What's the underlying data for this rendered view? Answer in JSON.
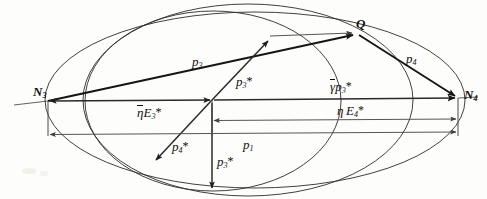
{
  "figure": {
    "type": "vector-geometry-diagram",
    "background_color": "#fdfdfb",
    "stroke_color": "#2b2b2b"
  },
  "nodes": {
    "n3": {
      "label": "N",
      "subscript": "3",
      "x": 48,
      "y": 101
    },
    "n4": {
      "label": "N",
      "subscript": "4",
      "x": 458,
      "y": 98
    },
    "q": {
      "label": "Q",
      "subscript": "",
      "x": 358,
      "y": 34
    },
    "origin": {
      "x": 212,
      "y": 100
    }
  },
  "labels": {
    "n3": "N",
    "n3_sub": "3",
    "n4": "N",
    "n4_sub": "4",
    "q": "Q",
    "p3": "p",
    "p3_sub": "3",
    "p4": "p",
    "p4_sub": "4",
    "p1": "p",
    "p1_sub": "1",
    "p3star": "p",
    "p3star_sub": "3",
    "p3star_mark": "*",
    "p4star": "p",
    "p4star_sub": "4",
    "p4star_mark": "*",
    "p3star_low": "p",
    "p3star_low_sub": "3",
    "p3star_low_mark": "*",
    "eta_bar_e3": "E",
    "eta_bar_e3_sub": "3",
    "eta_bar_e3_mark": "*",
    "eta_bar_sym": "η",
    "gamma_bar_sym": "γ",
    "gamma_bar_p3": "p",
    "gamma_bar_p3_sub": "3",
    "gamma_bar_p3_mark": "*",
    "eta_sym": "η",
    "eta_e4": "E",
    "eta_e4_sub": "4",
    "eta_e4_mark": "*"
  },
  "geometry": {
    "outer_ellipse": {
      "cx": 255,
      "cy": 100,
      "rx": 210,
      "ry": 88
    },
    "inner_circle": {
      "cx": 213,
      "cy": 101,
      "rx": 128,
      "ry": 90
    },
    "inner_ellipse": {
      "cx": 245,
      "cy": 100,
      "rx": 162,
      "ry": 96
    },
    "axis_y": 101,
    "baseline_eta_e4_y": 120,
    "baseline_p1_y": 134,
    "bottom_y": 191
  },
  "vectors": [
    {
      "name": "p3",
      "from": "N3",
      "to": "Q",
      "style": "heavy"
    },
    {
      "name": "p4",
      "from": "Q",
      "to": "N4",
      "style": "heavy"
    },
    {
      "name": "p3-star",
      "from": "origin",
      "to": "upper-left-arc",
      "style": "med"
    },
    {
      "name": "p4-star",
      "from": "origin",
      "to": "lower-left-arc",
      "style": "med"
    },
    {
      "name": "p3-star-low",
      "from": "origin",
      "to": "bottom",
      "style": "med"
    },
    {
      "name": "eta-bar-E3-star",
      "from": "N3",
      "to": "origin",
      "style": "double-headed"
    },
    {
      "name": "gamma-bar-p3-star",
      "from": "origin",
      "to": "N4",
      "style": "heavy"
    },
    {
      "name": "eta-E4-star",
      "from": "origin",
      "to": "N4",
      "style": "double-headed"
    },
    {
      "name": "p1",
      "from": "N3",
      "to": "N4",
      "style": "double-headed"
    },
    {
      "name": "q-horizontal",
      "from": "arc-point",
      "to": "Q",
      "style": "light"
    }
  ]
}
